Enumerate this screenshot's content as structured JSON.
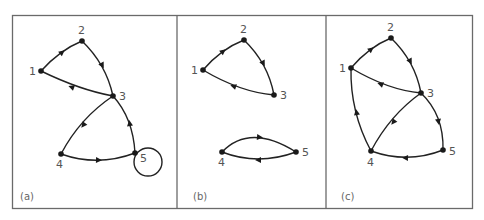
{
  "figure": {
    "colors": {
      "edge": "#222222",
      "node": "#1a1a1a",
      "label": "#555555",
      "frame": "#6a6a6a"
    },
    "panels": [
      {
        "label": "(a)",
        "nodes": [
          {
            "id": "1",
            "label": "1"
          },
          {
            "id": "2",
            "label": "2"
          },
          {
            "id": "3",
            "label": "3"
          },
          {
            "id": "4",
            "label": "4"
          },
          {
            "id": "5",
            "label": "5"
          }
        ],
        "edges": [
          {
            "from": "1",
            "to": "2"
          },
          {
            "from": "2",
            "to": "3"
          },
          {
            "from": "3",
            "to": "1"
          },
          {
            "from": "3",
            "to": "4"
          },
          {
            "from": "4",
            "to": "5"
          },
          {
            "from": "5",
            "to": "3"
          },
          {
            "from": "5",
            "to": "5",
            "type": "self-loop"
          }
        ]
      },
      {
        "label": "(b)",
        "nodes": [
          {
            "id": "1",
            "label": "1"
          },
          {
            "id": "2",
            "label": "2"
          },
          {
            "id": "3",
            "label": "3"
          },
          {
            "id": "4",
            "label": "4"
          },
          {
            "id": "5",
            "label": "5"
          }
        ],
        "edges": [
          {
            "from": "1",
            "to": "2"
          },
          {
            "from": "2",
            "to": "3"
          },
          {
            "from": "3",
            "to": "1"
          },
          {
            "from": "4",
            "to": "5"
          },
          {
            "from": "5",
            "to": "4"
          }
        ]
      },
      {
        "label": "(c)",
        "nodes": [
          {
            "id": "1",
            "label": "1"
          },
          {
            "id": "2",
            "label": "2"
          },
          {
            "id": "3",
            "label": "3"
          },
          {
            "id": "4",
            "label": "4"
          },
          {
            "id": "5",
            "label": "5"
          }
        ],
        "edges": [
          {
            "from": "1",
            "to": "2"
          },
          {
            "from": "2",
            "to": "3"
          },
          {
            "from": "3",
            "to": "1"
          },
          {
            "from": "3",
            "to": "4"
          },
          {
            "from": "4",
            "to": "1"
          },
          {
            "from": "3",
            "to": "5"
          },
          {
            "from": "5",
            "to": "4"
          }
        ]
      }
    ]
  }
}
